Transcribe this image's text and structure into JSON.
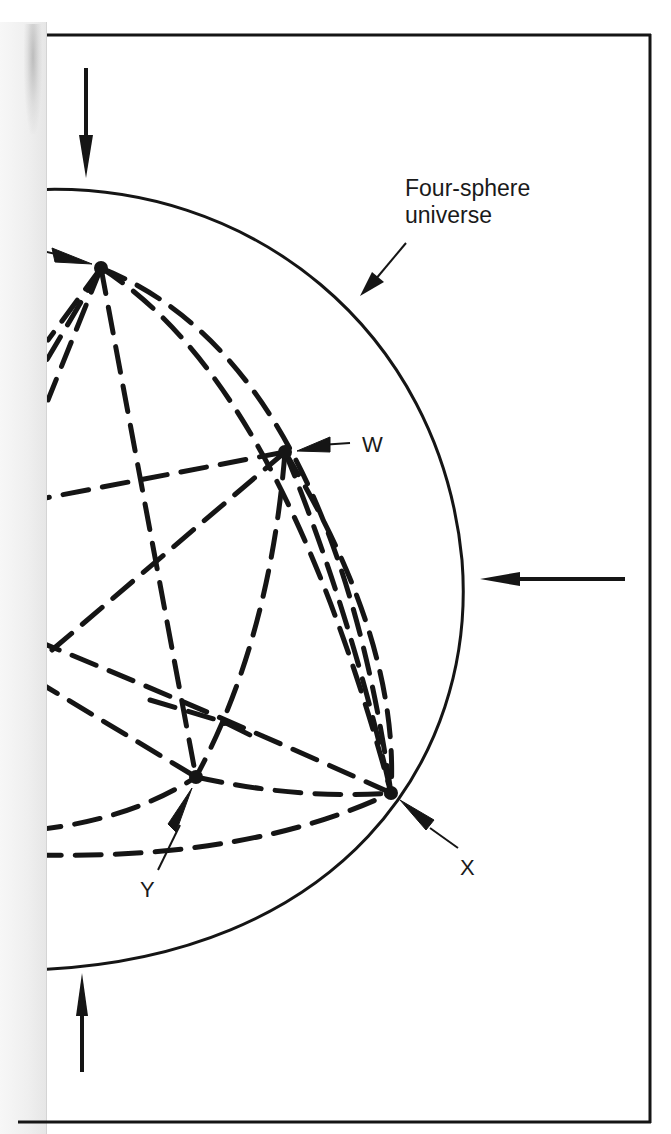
{
  "figure": {
    "title_label": {
      "line1": "Four-sphere",
      "line2": "universe"
    },
    "points": {
      "W": {
        "label": "W"
      },
      "X": {
        "label": "X"
      },
      "Y": {
        "label": "Y"
      }
    },
    "colors": {
      "ink": "#151515",
      "paper": "#ffffff",
      "page_strip": "#eeeeee"
    },
    "arrows": [
      {
        "id": "top-arrow",
        "direction": "down"
      },
      {
        "id": "right-arrow",
        "direction": "left"
      },
      {
        "id": "bottom-arrow",
        "direction": "up"
      },
      {
        "id": "label-pointer",
        "direction": "down-left"
      }
    ]
  }
}
